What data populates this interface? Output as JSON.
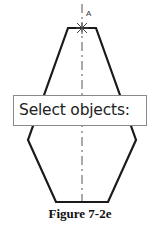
{
  "figure": {
    "caption": "Figure 7-2e",
    "point_label": "A",
    "colors": {
      "outline": "#1a1a1a",
      "centerline": "#555555",
      "marker": "#444444"
    }
  },
  "tooltip": {
    "prompt": "Select objects:"
  }
}
